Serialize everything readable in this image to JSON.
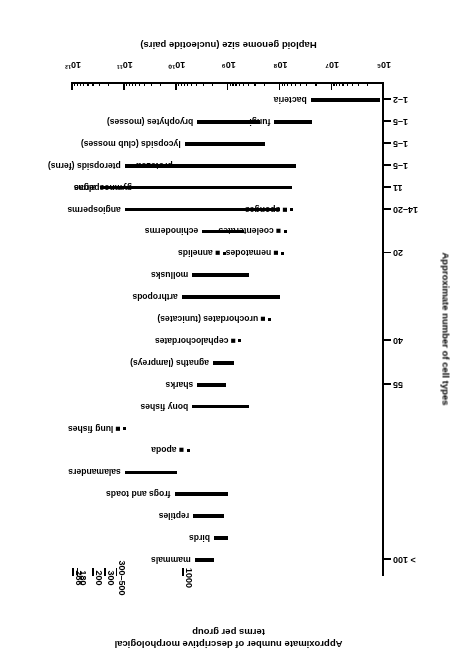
{
  "figure": {
    "top_axis_title_line1": "Approximate number of descriptive morphological",
    "top_axis_title_line2": "terms per group",
    "bottom_axis_title": "Haploid genome size (nucleotide pairs)",
    "left_axis_title": "Approximate number of cell types"
  },
  "chart_data": {
    "type": "bar",
    "xlabel": "Haploid genome size (nucleotide pairs)",
    "ylabel": "Approximate number of cell types",
    "secondary_ylabel": "Approximate number of descriptive morphological terms per group",
    "orientation": "horizontal-range-bars",
    "xscale": "log",
    "xlim": [
      1000000,
      1000000000000
    ],
    "xtick_labels": [
      "10⁶",
      "10⁷",
      "10⁸",
      "10⁹",
      "10¹⁰",
      "10¹¹",
      "10¹²"
    ],
    "xtick_values": [
      1000000,
      10000000,
      100000000,
      1000000000,
      10000000000,
      100000000000,
      1000000000000
    ],
    "grid": false,
    "legend": "none",
    "cell_type_axis_ticks": [
      {
        "label": "> 100",
        "row": 0
      },
      {
        "label": "55",
        "row": 8
      },
      {
        "label": "40",
        "row": 10
      },
      {
        "label": "20",
        "row": 14
      },
      {
        "label": "14–20",
        "row": 16
      },
      {
        "label": "11",
        "row": 17
      },
      {
        "label": "1–5",
        "row": 18
      },
      {
        "label": "1–5",
        "row": 19
      },
      {
        "label": "1–5",
        "row": 20
      },
      {
        "label": "1–2",
        "row": 21
      }
    ],
    "morphological_term_ticks": [
      {
        "label": "1000",
        "x": 7200000000
      },
      {
        "label": "300–500",
        "x": 140000000000
      },
      {
        "label": "300",
        "x": 230000000000
      },
      {
        "label": "200",
        "x": 400000000000
      },
      {
        "label": "180",
        "x": 790000000000
      },
      {
        "label": "266",
        "x": 960000000000
      }
    ],
    "series": [
      {
        "name": "mammals",
        "min": 1900000000.0,
        "max": 4500000000.0,
        "point": false
      },
      {
        "name": "birds",
        "min": 1000000000.0,
        "max": 1900000000.0,
        "point": false
      },
      {
        "name": "reptiles",
        "min": 1200000000.0,
        "max": 4800000000.0,
        "point": false
      },
      {
        "name": "frogs and toads",
        "min": 1000000000.0,
        "max": 11000000000.0,
        "point": false
      },
      {
        "name": "salamanders",
        "min": 10000000000.0,
        "max": 100000000000.0,
        "point": false
      },
      {
        "name": "apoda",
        "min": 6000000000.0,
        "max": 6000000000.0,
        "point": true
      },
      {
        "name": "lung fishes",
        "min": 100000000000.0,
        "max": 100000000000.0,
        "point": true
      },
      {
        "name": "bony fishes",
        "min": 400000000.0,
        "max": 5000000000.0,
        "point": false
      },
      {
        "name": "sharks",
        "min": 1100000000.0,
        "max": 4000000000.0,
        "point": false
      },
      {
        "name": "agnaths (lampreys)",
        "min": 800000000.0,
        "max": 2000000000.0,
        "point": false
      },
      {
        "name": "cephalochordates",
        "min": 600000000.0,
        "max": 600000000.0,
        "point": true
      },
      {
        "name": "urochordates (tunicates)",
        "min": 160000000.0,
        "max": 160000000.0,
        "point": true
      },
      {
        "name": "arthropods",
        "min": 100000000.0,
        "max": 8000000000.0,
        "point": false
      },
      {
        "name": "mollusks",
        "min": 400000000.0,
        "max": 5000000000.0,
        "point": false
      },
      {
        "name": "annelids",
        "min": 1200000000.0,
        "max": 1200000000.0,
        "point": true
      },
      {
        "name": "echinoderms",
        "min": 500000000.0,
        "max": 3200000000.0,
        "point": false
      },
      {
        "name": "angiosperms",
        "min": 100000000.0,
        "max": 100000000000.0,
        "point": false
      },
      {
        "name": "gymnosperms",
        "min": 2500000000.0,
        "max": 60000000000.0,
        "point": false
      },
      {
        "name": "pteropsids (ferns)",
        "min": 220000000.0,
        "max": 100000000000.0,
        "point": false
      },
      {
        "name": "lycopsids (club mosses)",
        "min": 200000000.0,
        "max": 7000000000.0,
        "point": false
      },
      {
        "name": "bryophytes (mosses)",
        "min": 250000000.0,
        "max": 4000000000.0,
        "point": false
      },
      {
        "name": "nematodes",
        "min": 90000000.0,
        "max": 90000000.0,
        "point": true
      },
      {
        "name": "coelenterates",
        "min": 80000000.0,
        "max": 80000000.0,
        "point": true
      },
      {
        "name": "sponges",
        "min": 60000000.0,
        "max": 60000000.0,
        "point": true
      },
      {
        "name": "algae",
        "min": 60000000.0,
        "max": 300000000000.0,
        "point": false
      },
      {
        "name": "protozoa",
        "min": 50000000.0,
        "max": 10000000000.0,
        "point": false
      },
      {
        "name": "fungi",
        "min": 25000000.0,
        "max": 130000000.0,
        "point": false
      },
      {
        "name": "bacteria",
        "min": 1200000.0,
        "max": 26000000.0,
        "point": false
      }
    ]
  }
}
